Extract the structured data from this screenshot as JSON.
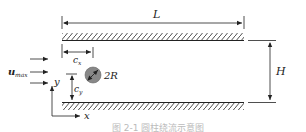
{
  "diagram": {
    "labels": {
      "length": "L",
      "height": "H",
      "cx": "c",
      "cx_sub": "x",
      "cy": "c",
      "cy_sub": "y",
      "diameter": "2R",
      "inflow": "u",
      "inflow_sub": "max",
      "axis_x": "x",
      "axis_y": "y"
    },
    "caption": "图 2-1  圆柱绕流示意图",
    "colors": {
      "line": "#222222",
      "cylinder": "#888888",
      "caption": "#bbbbbb"
    }
  }
}
